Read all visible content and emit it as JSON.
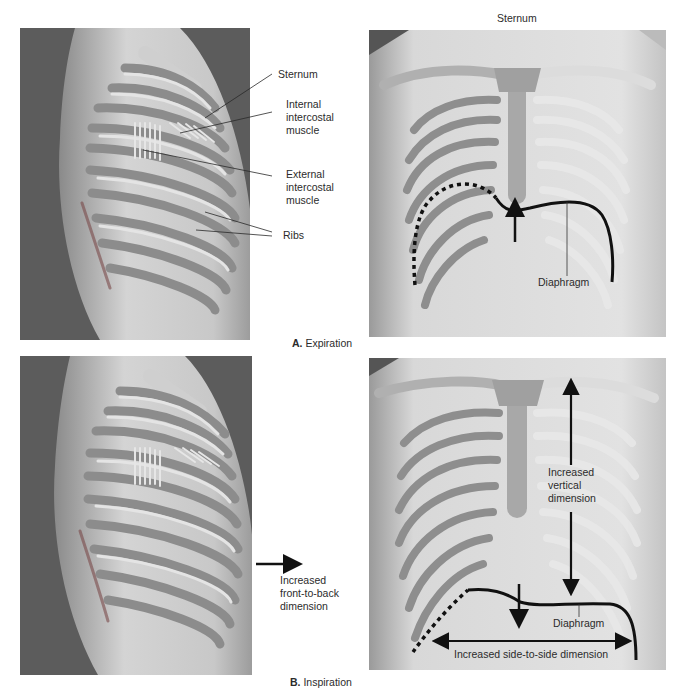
{
  "figure": {
    "panel_a": {
      "caption_letter": "A.",
      "caption_text": "Expiration",
      "lateral_labels": {
        "sternum": "Sternum",
        "internal_intercostal": [
          "Internal",
          "intercostal",
          "muscle"
        ],
        "external_intercostal": [
          "External",
          "intercostal",
          "muscle"
        ],
        "ribs": "Ribs"
      },
      "frontal_labels": {
        "sternum": "Sternum",
        "diaphragm": "Diaphragm"
      }
    },
    "panel_b": {
      "caption_letter": "B.",
      "caption_text": "Inspiration",
      "lateral_labels": {
        "front_to_back": [
          "Increased",
          "front-to-back",
          "dimension"
        ]
      },
      "frontal_labels": {
        "vertical": [
          "Increased",
          "vertical",
          "dimension"
        ],
        "diaphragm": "Diaphragm",
        "side_to_side": "Increased side-to-side dimension"
      }
    }
  },
  "colors": {
    "dark_background": "#5a5a5a",
    "body_light": "#d8d8d8",
    "rib_gray": "#9a9a9a",
    "rib_dark": "#6e6e6e",
    "annotation_line": "#111111",
    "text": "#2b2b2b"
  }
}
